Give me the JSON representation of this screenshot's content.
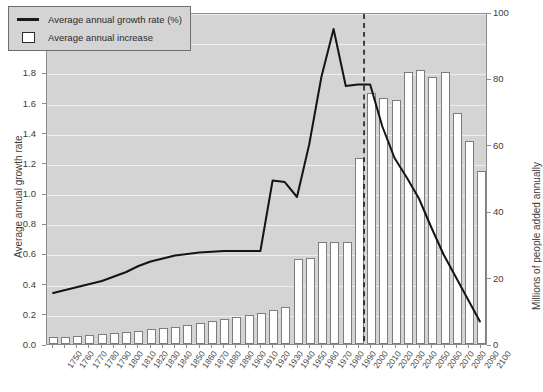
{
  "chart_data": {
    "type": "bar",
    "title": "",
    "subtitle": "",
    "xlabel": "",
    "ylabel": "Average annual growth rate",
    "ylabel_right": "Millions of people added annually",
    "grid": true,
    "legend_position": "top-left",
    "legend": [
      {
        "label": "Average annual growth rate (%)",
        "marker": "line"
      },
      {
        "label": "Average annual increase",
        "marker": "box"
      }
    ],
    "ylim": [
      0.0,
      2.2
    ],
    "ylim_right": [
      0,
      100
    ],
    "yticks": [
      "0.0",
      "0.2",
      "0.4",
      "0.6",
      "0.8",
      "1.0",
      "1.2",
      "1.4",
      "1.6",
      "1.8",
      "2.0",
      "2.2"
    ],
    "ytick_values": [
      0.0,
      0.2,
      0.4,
      0.6,
      0.8,
      1.0,
      1.2,
      1.4,
      1.6,
      1.8,
      2.0,
      2.2
    ],
    "yticks_right": [
      "0",
      "20",
      "40",
      "60",
      "80",
      "100"
    ],
    "ytick_values_right": [
      0,
      20,
      40,
      60,
      80,
      100
    ],
    "categories": [
      "1750",
      "1760",
      "1770",
      "1780",
      "1790",
      "1800",
      "1810",
      "1820",
      "1830",
      "1840",
      "1850",
      "1860",
      "1870",
      "1880",
      "1890",
      "1900",
      "1910",
      "1920",
      "1930",
      "1940",
      "1950",
      "1960",
      "1970",
      "1980",
      "1990",
      "2000",
      "2010",
      "2020",
      "2030",
      "2040",
      "2050",
      "2060",
      "2070",
      "2080",
      "2090",
      "2100"
    ],
    "series": [
      {
        "name": "Average annual increase",
        "axis": "right",
        "units": "millions of people added annually",
        "type": "bar",
        "values": [
          2.0,
          2.2,
          2.5,
          2.6,
          3.0,
          3.3,
          3.6,
          4.0,
          4.4,
          4.8,
          5.2,
          5.7,
          6.2,
          6.8,
          7.4,
          8.1,
          8.7,
          9.3,
          10.2,
          11.0,
          25.5,
          25.8,
          30.6,
          30.6,
          30.8,
          56.0,
          75.5,
          74.0,
          73.5,
          82.0,
          82.5,
          80.5,
          82.0,
          69.5,
          61.0,
          52.0
        ]
      },
      {
        "name": "Average annual growth rate (%)",
        "axis": "left",
        "units": "percent",
        "type": "line",
        "values": [
          0.34,
          0.36,
          0.38,
          0.4,
          0.42,
          0.45,
          0.48,
          0.52,
          0.55,
          0.57,
          0.59,
          0.6,
          0.61,
          0.615,
          0.62,
          0.62,
          0.62,
          0.62,
          1.09,
          1.08,
          0.98,
          1.33,
          1.78,
          2.1,
          1.72,
          1.73,
          1.73,
          1.45,
          1.24,
          1.11,
          0.97,
          0.78,
          0.6,
          0.45,
          0.3,
          0.15
        ]
      }
    ],
    "annotations": [
      {
        "type": "vertical-dashed-line",
        "at_category": "2005",
        "style": "dashed",
        "color": "#1b1b1b"
      }
    ]
  }
}
